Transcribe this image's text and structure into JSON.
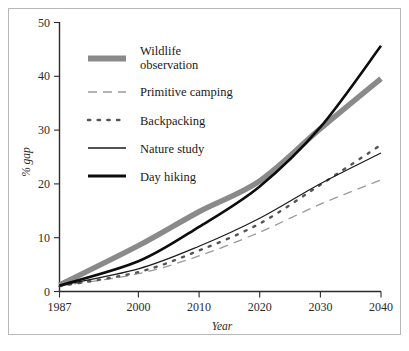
{
  "chart_data": {
    "type": "line",
    "title": "",
    "xlabel": "Year",
    "ylabel": "% gap",
    "xlim": [
      1987,
      2040
    ],
    "ylim": [
      0,
      50
    ],
    "grid": false,
    "legend_position": "upper-left-inside",
    "x": [
      1987,
      2000,
      2010,
      2020,
      2030,
      2040
    ],
    "xtick_labels": [
      "1987",
      "2000",
      "2010",
      "2020",
      "2030",
      "2040"
    ],
    "ytick_labels": [
      "0",
      "10",
      "20",
      "30",
      "40",
      "50"
    ],
    "yticks": [
      0,
      10,
      20,
      30,
      40,
      50
    ],
    "series": [
      {
        "name": "Wildlife observation",
        "style": "thick-gray-solid",
        "color": "#8a8a8a",
        "width": 5.5,
        "dash": "none",
        "values": [
          1.2,
          8.5,
          14.8,
          20.5,
          30.2,
          39.5
        ]
      },
      {
        "name": "Primitive camping",
        "style": "gray-dashed",
        "color": "#9a9a9a",
        "width": 1.3,
        "dash": "7,5",
        "values": [
          1.0,
          3.3,
          6.6,
          11.0,
          16.2,
          20.7
        ]
      },
      {
        "name": "Backpacking",
        "style": "gray-dotted",
        "color": "#555555",
        "width": 2.4,
        "dash": "1,5",
        "values": [
          1.0,
          3.6,
          7.6,
          12.6,
          19.8,
          27.2
        ]
      },
      {
        "name": "Nature study",
        "style": "thin-black-solid",
        "color": "#1a1a1a",
        "width": 1.2,
        "dash": "none",
        "values": [
          1.1,
          4.2,
          8.4,
          13.6,
          20.0,
          25.7
        ]
      },
      {
        "name": "Day hiking",
        "style": "thick-black-solid",
        "color": "#0d0d0d",
        "width": 2.6,
        "dash": "none",
        "values": [
          1.1,
          5.6,
          12.0,
          19.5,
          30.5,
          45.6
        ]
      }
    ]
  },
  "legend": {
    "entries": [
      {
        "label_line1": "Wildlife",
        "label_line2": "observation",
        "series": 0
      },
      {
        "label_line1": "Primitive camping",
        "label_line2": "",
        "series": 1
      },
      {
        "label_line1": "Backpacking",
        "label_line2": "",
        "series": 2
      },
      {
        "label_line1": "Nature study",
        "label_line2": "",
        "series": 3
      },
      {
        "label_line1": "Day hiking",
        "label_line2": "",
        "series": 4
      }
    ]
  },
  "axes": {
    "x_title": "Year",
    "y_title": "% gap",
    "x_ticks": [
      "1987",
      "2000",
      "2010",
      "2020",
      "2030",
      "2040"
    ],
    "y_ticks": [
      "50",
      "40",
      "30",
      "20",
      "10",
      "0"
    ]
  }
}
